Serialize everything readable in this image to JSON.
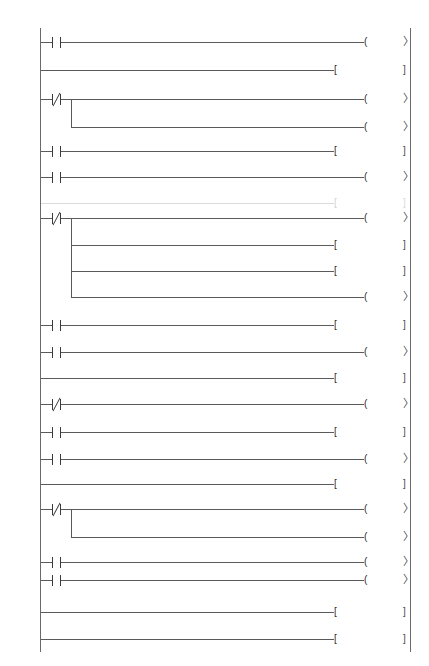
{
  "document": {
    "type": "ladder-logic-diagram",
    "plc_family": "Mitsubishi FX",
    "background_color": "#ffffff",
    "line_color": "#5a5a5a",
    "text_color": "#2b2b2b"
  },
  "rungs": [
    {
      "line_number": "45",
      "y": 42,
      "contact": {
        "label": "X004",
        "type": "normally-open"
      },
      "outputs": [
        {
          "kind": "coil",
          "label": "S0",
          "preset": null,
          "terminator": "arrow"
        }
      ]
    },
    {
      "line_number": "48",
      "y": 70,
      "contact": null,
      "outputs": [
        {
          "kind": "instruction",
          "mnemonic": "STL",
          "operand": "S23",
          "terminator": "bracket"
        }
      ]
    },
    {
      "line_number": "49",
      "y": 99,
      "contact": {
        "label": "M0",
        "type": "normally-closed"
      },
      "outputs": [
        {
          "kind": "coil",
          "label": "Y004",
          "preset": null,
          "terminator": "arrow"
        },
        {
          "kind": "coil",
          "label": "T3",
          "preset": "K30",
          "terminator": "arrow",
          "branch_y": 127
        }
      ]
    },
    {
      "line_number": "54",
      "y": 151,
      "contact": {
        "label": "T3",
        "type": "normally-open"
      },
      "outputs": [
        {
          "kind": "instruction",
          "mnemonic": "SET",
          "operand": "S24",
          "terminator": "bracket"
        }
      ]
    },
    {
      "line_number": "57",
      "y": 177,
      "contact": {
        "label": "X004",
        "type": "normally-open"
      },
      "outputs": [
        {
          "kind": "coil",
          "label": "S0",
          "preset": null,
          "terminator": "arrow"
        }
      ]
    },
    {
      "line_number": "60",
      "y": 203,
      "faint": true,
      "contact": null,
      "outputs": [
        {
          "kind": "instruction",
          "mnemonic": "STL",
          "operand": "S24",
          "terminator": "bracket"
        }
      ]
    },
    {
      "line_number": "61",
      "y": 218,
      "contact": {
        "label": "M0",
        "type": "normally-closed"
      },
      "outputs": [
        {
          "kind": "coil",
          "label": "Y002",
          "preset": null,
          "terminator": "arrow"
        },
        {
          "kind": "instruction",
          "mnemonic": "SET",
          "operand": "Y005",
          "terminator": "bracket",
          "branch_y": 245
        },
        {
          "kind": "instruction",
          "mnemonic": "RST",
          "operand": "Y000",
          "terminator": "bracket",
          "branch_y": 271
        },
        {
          "kind": "coil",
          "label": "T4",
          "preset": "K80",
          "terminator": "arrow",
          "branch_y": 297
        }
      ]
    },
    {
      "line_number": "68",
      "y": 325,
      "contact": {
        "label": "T4",
        "type": "normally-open"
      },
      "outputs": [
        {
          "kind": "instruction",
          "mnemonic": "SET",
          "operand": "S25",
          "terminator": "bracket"
        }
      ]
    },
    {
      "line_number": "71",
      "y": 352,
      "contact": {
        "label": "X004",
        "type": "normally-open"
      },
      "outputs": [
        {
          "kind": "coil",
          "label": "S0",
          "preset": null,
          "terminator": "arrow"
        }
      ]
    },
    {
      "line_number": "74",
      "y": 378,
      "contact": null,
      "outputs": [
        {
          "kind": "instruction",
          "mnemonic": "STL",
          "operand": "S25",
          "terminator": "bracket"
        }
      ]
    },
    {
      "line_number": "79",
      "y": 404,
      "contact": {
        "label": "M0",
        "type": "normally-closed"
      },
      "outputs": [
        {
          "kind": "coil",
          "label": "T5",
          "preset": "K20",
          "terminator": "arrow"
        }
      ]
    },
    {
      "line_number": "81",
      "y": 432,
      "contact": {
        "label": "T5",
        "type": "normally-open"
      },
      "outputs": [
        {
          "kind": "instruction",
          "mnemonic": "SET",
          "operand": "S26",
          "terminator": "bracket"
        }
      ]
    },
    {
      "line_number": "84",
      "y": 459,
      "contact": {
        "label": "X004",
        "type": "normally-open"
      },
      "outputs": [
        {
          "kind": "coil",
          "label": "S0",
          "preset": null,
          "terminator": "arrow"
        }
      ]
    },
    {
      "line_number": "87",
      "y": 484,
      "contact": null,
      "outputs": [
        {
          "kind": "instruction",
          "mnemonic": "STL",
          "operand": "S26",
          "terminator": "bracket"
        }
      ]
    },
    {
      "line_number": "88",
      "y": 509,
      "contact": {
        "label": "M0",
        "type": "normally-closed"
      },
      "outputs": [
        {
          "kind": "coil",
          "label": "Y001",
          "preset": null,
          "terminator": "arrow"
        },
        {
          "kind": "coil",
          "label": "T6",
          "preset": "K30",
          "terminator": "arrow",
          "branch_y": 537
        }
      ]
    },
    {
      "line_number": "93",
      "y": 562,
      "contact": {
        "label": "T6",
        "type": "normally-open"
      },
      "outputs": [
        {
          "kind": "coil",
          "label": "S21",
          "preset": null,
          "terminator": "arrow"
        }
      ]
    },
    {
      "line_number": "96",
      "y": 580,
      "contact": {
        "label": "X004",
        "type": "normally-open"
      },
      "outputs": [
        {
          "kind": "coil",
          "label": "S0",
          "preset": null,
          "terminator": "arrow"
        }
      ]
    },
    {
      "line_number": "99",
      "y": 612,
      "contact": null,
      "outputs": [
        {
          "kind": "instruction",
          "mnemonic": "RET",
          "operand": "",
          "terminator": "bracket"
        }
      ]
    },
    {
      "line_number": "100",
      "y": 639,
      "contact": null,
      "outputs": [
        {
          "kind": "instruction",
          "mnemonic": "END",
          "operand": "",
          "terminator": "bracket"
        }
      ]
    }
  ]
}
